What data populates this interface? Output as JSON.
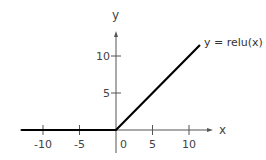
{
  "chart_data": {
    "type": "line",
    "title": "",
    "xlabel": "x",
    "ylabel": "y",
    "xlim": [
      -13,
      13.5
    ],
    "ylim": [
      -3,
      13
    ],
    "grid": false,
    "x_ticks": [
      -10,
      -5,
      0,
      5,
      10
    ],
    "x_tick_labels": [
      "-10",
      "-5",
      "0",
      "5",
      "10"
    ],
    "y_ticks": [
      5,
      10
    ],
    "y_tick_labels": [
      "5",
      "10"
    ],
    "series": [
      {
        "name": "y = relu(x)",
        "x": [
          -13,
          0,
          11.5
        ],
        "y": [
          0,
          0,
          11.5
        ],
        "color": "#000000"
      }
    ],
    "annotations": [
      {
        "text": "y = relu(x)",
        "x": 12,
        "y": 11.8
      }
    ],
    "legend_position": "none"
  }
}
